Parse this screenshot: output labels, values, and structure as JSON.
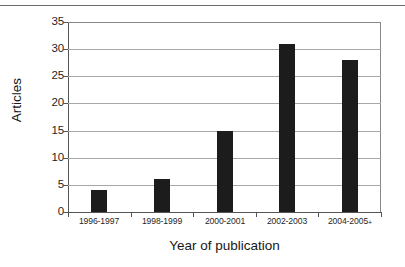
{
  "figure": {
    "rule_top": true
  },
  "chart_data": {
    "type": "bar",
    "title": "",
    "xlabel": "Year of publication",
    "ylabel": "Articles",
    "categories": [
      "1996-1997",
      "1998-1999",
      "2000-2001",
      "2002-2003",
      "2004-2005+"
    ],
    "values": [
      4,
      6,
      15,
      31,
      28
    ],
    "ylim": [
      0,
      35
    ],
    "yticks": [
      0,
      5,
      10,
      15,
      20,
      25,
      30,
      35
    ],
    "ytick_labels": [
      "0",
      "5",
      "10",
      "15",
      "20",
      "25",
      "30",
      "35"
    ],
    "grid": true,
    "grid_axis": "y",
    "legend": false,
    "bar_color": "#1c1c1c",
    "grid_color": "#a8a8a8",
    "axis_color": "#555555",
    "background": "#ffffff"
  }
}
